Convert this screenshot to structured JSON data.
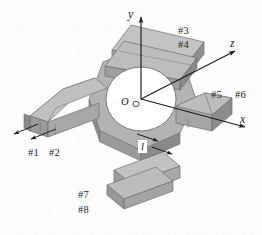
{
  "figure": {
    "type": "engineering-3d-diagram",
    "background_color": "#fdfdfd",
    "line_color": "#1c1c1c",
    "body_fill_top": "#b9b9b9",
    "body_fill_front": "#a3a3a3",
    "body_fill_side": "#8f8f8f",
    "body_fill_light": "#c9c9c9",
    "hole_fill": "#ffffff"
  },
  "axes": {
    "origin_label": "O",
    "x_label": "x",
    "y_label": "y",
    "z_label": "z"
  },
  "dimension": {
    "length_label": "l"
  },
  "gauges": [
    {
      "id": "g1",
      "label": "#1",
      "beam": "left"
    },
    {
      "id": "g2",
      "label": "#2",
      "beam": "left"
    },
    {
      "id": "g3",
      "label": "#3",
      "beam": "top"
    },
    {
      "id": "g4",
      "label": "#4",
      "beam": "top"
    },
    {
      "id": "g5",
      "label": "#5",
      "beam": "right"
    },
    {
      "id": "g6",
      "label": "#6",
      "beam": "right"
    },
    {
      "id": "g7",
      "label": "#7",
      "beam": "bottom"
    },
    {
      "id": "g8",
      "label": "#8",
      "beam": "bottom"
    }
  ]
}
